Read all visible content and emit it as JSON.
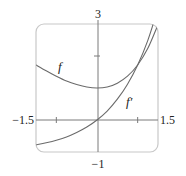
{
  "chart_data": {
    "type": "line",
    "title": "",
    "xlabel": "",
    "ylabel": "",
    "xlim": [
      -1.5,
      1.5
    ],
    "ylim": [
      -1,
      3
    ],
    "grid": false,
    "axis_labels": {
      "x_min": "−1.5",
      "x_max": "1.5",
      "y_max": "3",
      "y_min": "−1"
    },
    "ticks": {
      "x": [
        -1,
        1
      ],
      "y": [
        2
      ]
    },
    "series": [
      {
        "name": "f",
        "label": "f",
        "x": [
          -1.5,
          -1.25,
          -1.0,
          -0.75,
          -0.5,
          -0.25,
          0.0,
          0.25,
          0.5,
          0.75,
          1.0,
          1.25,
          1.5
        ],
        "values": [
          1.72,
          1.54,
          1.37,
          1.22,
          1.11,
          1.03,
          1.0,
          1.03,
          1.15,
          1.37,
          1.72,
          2.24,
          2.98
        ]
      },
      {
        "name": "f'",
        "label": "f′",
        "x": [
          -1.5,
          -1.25,
          -1.0,
          -0.75,
          -0.5,
          -0.25,
          0.0,
          0.25,
          0.5,
          0.75,
          1.0,
          1.25,
          1.5
        ],
        "values": [
          -0.78,
          -0.71,
          -0.63,
          -0.53,
          -0.39,
          -0.22,
          0.0,
          0.28,
          0.65,
          1.12,
          1.72,
          2.49,
          3.48
        ]
      }
    ],
    "colors": {
      "curve": "#6b6b6b",
      "axis": "#7a7a7a",
      "frame": "#c8c8c8"
    }
  }
}
